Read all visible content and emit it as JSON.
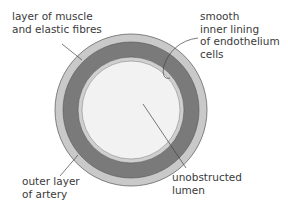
{
  "diagram": {
    "labels": {
      "muscle": [
        "layer of muscle",
        "and elastic fibres"
      ],
      "lining": [
        "smooth",
        "inner lining",
        "of endothelium",
        "cells"
      ],
      "outer": [
        "outer layer",
        "of artery"
      ],
      "lumen": [
        "unobstructed",
        "lumen"
      ]
    },
    "colors": {
      "outer_layer": "#c9c9c9",
      "muscle_layer": "#7a7a7a",
      "inner_lining": "#cfcfcf",
      "lumen": "#f2f2f2",
      "outline": "#555555",
      "leader_line": "#444444",
      "text": "#3a3a3a"
    }
  }
}
